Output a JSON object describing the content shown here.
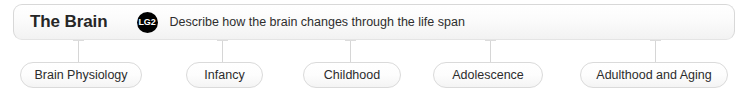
{
  "header": {
    "title": "The Brain",
    "badge": "LG2",
    "description": "Describe how the brain changes through the life span"
  },
  "nodes": [
    {
      "label": "Brain Physiology",
      "left": 20,
      "width": 122,
      "connector_x": 78
    },
    {
      "label": "Infancy",
      "left": 186,
      "width": 77,
      "connector_x": 222
    },
    {
      "label": "Childhood",
      "left": 303,
      "width": 98,
      "connector_x": 350
    },
    {
      "label": "Adolescence",
      "left": 433,
      "width": 110,
      "connector_x": 490
    },
    {
      "label": "Adulthood and Aging",
      "left": 580,
      "width": 148,
      "connector_x": 655
    }
  ],
  "colors": {
    "badge_background": "#000000",
    "badge_text": "#ffffff",
    "border": "#dadada",
    "text": "#2c2c2c",
    "title_text": "#262626",
    "connector": "#d6d6d6"
  }
}
